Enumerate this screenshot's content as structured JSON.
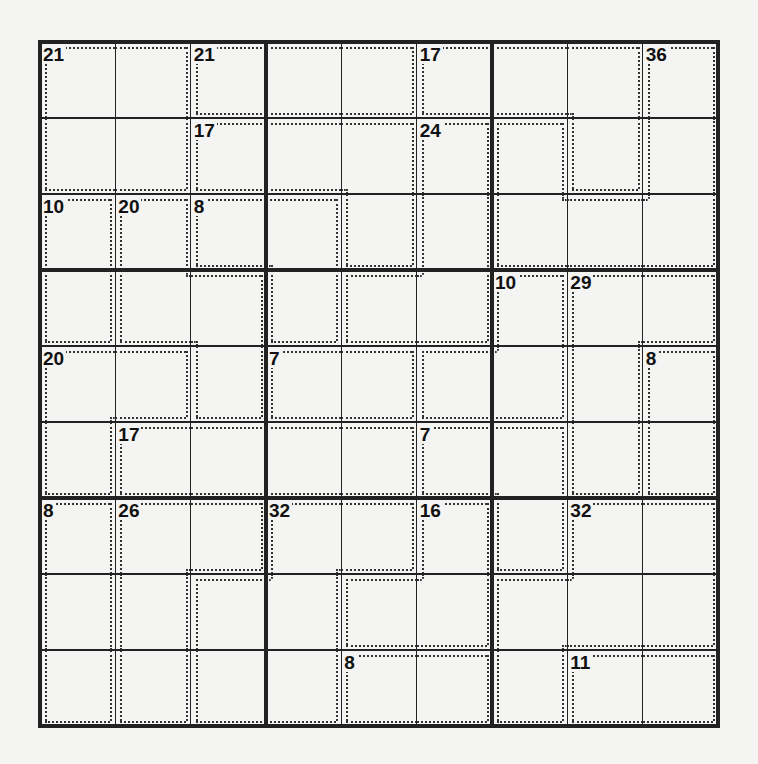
{
  "puzzle": {
    "type": "killer-sudoku",
    "size": 9,
    "cages": [
      {
        "sum": 21,
        "cells": [
          [
            0,
            0
          ],
          [
            0,
            1
          ],
          [
            1,
            0
          ],
          [
            1,
            1
          ]
        ]
      },
      {
        "sum": 21,
        "cells": [
          [
            0,
            2
          ],
          [
            0,
            3
          ],
          [
            0,
            4
          ]
        ]
      },
      {
        "sum": 17,
        "cells": [
          [
            0,
            5
          ],
          [
            0,
            6
          ],
          [
            0,
            7
          ],
          [
            1,
            7
          ]
        ]
      },
      {
        "sum": 36,
        "cells": [
          [
            0,
            8
          ],
          [
            1,
            8
          ],
          [
            2,
            8
          ],
          [
            2,
            7
          ],
          [
            2,
            6
          ],
          [
            1,
            6
          ]
        ]
      },
      {
        "sum": 17,
        "cells": [
          [
            1,
            2
          ],
          [
            1,
            3
          ],
          [
            1,
            4
          ],
          [
            2,
            4
          ]
        ]
      },
      {
        "sum": 24,
        "cells": [
          [
            1,
            5
          ],
          [
            2,
            5
          ],
          [
            3,
            5
          ],
          [
            3,
            4
          ]
        ]
      },
      {
        "sum": 10,
        "cells": [
          [
            2,
            0
          ],
          [
            3,
            0
          ]
        ]
      },
      {
        "sum": 20,
        "cells": [
          [
            2,
            1
          ],
          [
            3,
            1
          ],
          [
            3,
            2
          ],
          [
            4,
            2
          ]
        ]
      },
      {
        "sum": 8,
        "cells": [
          [
            2,
            2
          ],
          [
            2,
            3
          ],
          [
            3,
            3
          ]
        ]
      },
      {
        "sum": 10,
        "cells": [
          [
            3,
            6
          ],
          [
            4,
            6
          ],
          [
            4,
            5
          ]
        ]
      },
      {
        "sum": 29,
        "cells": [
          [
            3,
            7
          ],
          [
            3,
            8
          ],
          [
            4,
            7
          ],
          [
            5,
            7
          ]
        ]
      },
      {
        "sum": 20,
        "cells": [
          [
            4,
            0
          ],
          [
            4,
            1
          ],
          [
            5,
            0
          ]
        ]
      },
      {
        "sum": 7,
        "cells": [
          [
            4,
            3
          ],
          [
            4,
            4
          ]
        ]
      },
      {
        "sum": 8,
        "cells": [
          [
            4,
            8
          ],
          [
            5,
            8
          ]
        ]
      },
      {
        "sum": 17,
        "cells": [
          [
            5,
            1
          ],
          [
            5,
            2
          ],
          [
            5,
            3
          ],
          [
            5,
            4
          ]
        ]
      },
      {
        "sum": 7,
        "cells": [
          [
            5,
            5
          ],
          [
            5,
            6
          ],
          [
            6,
            6
          ]
        ]
      },
      {
        "sum": 8,
        "cells": [
          [
            6,
            0
          ],
          [
            7,
            0
          ],
          [
            8,
            0
          ]
        ]
      },
      {
        "sum": 26,
        "cells": [
          [
            6,
            1
          ],
          [
            6,
            2
          ],
          [
            7,
            1
          ],
          [
            8,
            1
          ]
        ]
      },
      {
        "sum": 32,
        "cells": [
          [
            6,
            3
          ],
          [
            6,
            4
          ],
          [
            7,
            3
          ],
          [
            8,
            3
          ],
          [
            7,
            2
          ],
          [
            8,
            2
          ]
        ]
      },
      {
        "sum": 16,
        "cells": [
          [
            6,
            5
          ],
          [
            7,
            5
          ],
          [
            7,
            4
          ]
        ]
      },
      {
        "sum": 32,
        "cells": [
          [
            6,
            7
          ],
          [
            6,
            8
          ],
          [
            7,
            7
          ],
          [
            7,
            8
          ],
          [
            7,
            6
          ],
          [
            8,
            6
          ]
        ]
      },
      {
        "sum": 8,
        "cells": [
          [
            8,
            4
          ],
          [
            8,
            5
          ]
        ]
      },
      {
        "sum": 11,
        "cells": [
          [
            8,
            7
          ],
          [
            8,
            8
          ]
        ]
      }
    ]
  }
}
